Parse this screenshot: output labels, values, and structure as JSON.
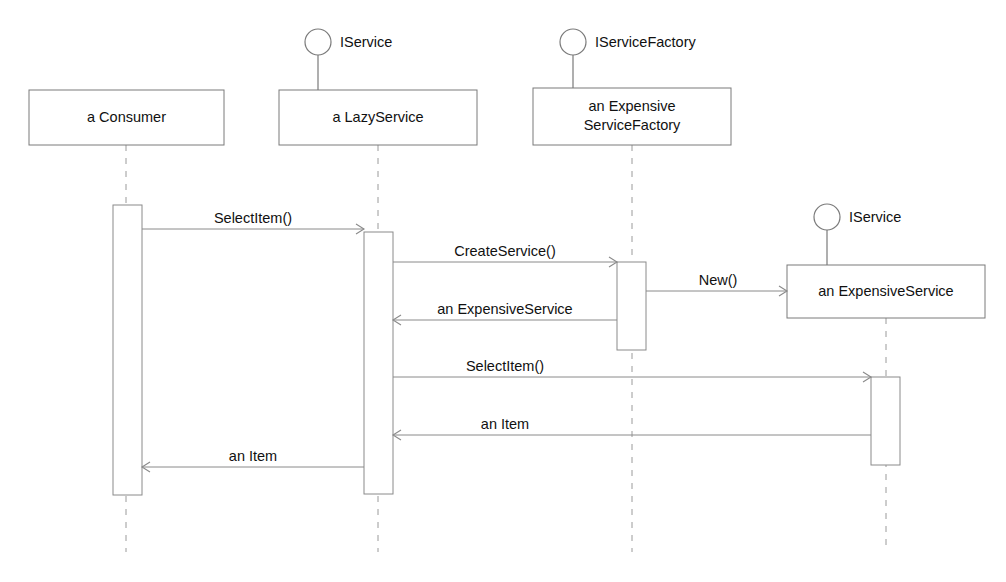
{
  "diagram": {
    "type": "uml-sequence-diagram",
    "title": "",
    "background_color": "#ffffff",
    "line_color": "#8a8a8a",
    "text_color": "#111111"
  },
  "participants": [
    {
      "id": "consumer",
      "label": "a Consumer",
      "label_line1": "a Consumer",
      "label_line2": "",
      "interface": null,
      "box": {
        "x": 29,
        "y": 90,
        "w": 195,
        "h": 55
      },
      "lifeline_x": 126,
      "lifeline_top": 145,
      "lifeline_bottom": 552
    },
    {
      "id": "lazyservice",
      "label": "a LazyService",
      "label_line1": "a LazyService",
      "label_line2": "",
      "interface": "IService",
      "box": {
        "x": 279,
        "y": 90,
        "w": 198,
        "h": 55
      },
      "lifeline_x": 378,
      "lifeline_top": 145,
      "lifeline_bottom": 552,
      "lollipop": {
        "cx": 318,
        "cy": 42,
        "r": 13,
        "stem_to_y": 90,
        "label_x": 340,
        "label_y": 43
      }
    },
    {
      "id": "factory",
      "label": "an Expensive ServiceFactory",
      "label_line1": "an Expensive",
      "label_line2": "ServiceFactory",
      "interface": "IServiceFactory",
      "box": {
        "x": 533,
        "y": 88,
        "w": 198,
        "h": 57
      },
      "lifeline_x": 632,
      "lifeline_top": 145,
      "lifeline_bottom": 552,
      "lollipop": {
        "cx": 573,
        "cy": 42,
        "r": 13,
        "stem_to_y": 88,
        "label_x": 595,
        "label_y": 43
      }
    },
    {
      "id": "expensiveservice",
      "label": "an ExpensiveService",
      "label_line1": "an ExpensiveService",
      "label_line2": "",
      "interface": "IService",
      "box": {
        "x": 787,
        "y": 265,
        "w": 198,
        "h": 53
      },
      "lifeline_x": 886,
      "lifeline_top": 318,
      "lifeline_bottom": 552,
      "lollipop": {
        "cx": 827,
        "cy": 217,
        "r": 13,
        "stem_to_y": 265,
        "label_x": 849,
        "label_y": 218
      }
    }
  ],
  "activations": [
    {
      "id": "act-consumer",
      "owner": "a Consumer",
      "x": 113,
      "y": 205,
      "w": 29,
      "h": 290
    },
    {
      "id": "act-lazyservice",
      "owner": "a LazyService",
      "x": 364,
      "y": 232,
      "w": 29,
      "h": 262
    },
    {
      "id": "act-factory",
      "owner": "an ExpensiveServiceFactory",
      "x": 617,
      "y": 262,
      "w": 29,
      "h": 88
    },
    {
      "id": "act-expensiveservice",
      "owner": "an ExpensiveService",
      "x": 871,
      "y": 377,
      "w": 29,
      "h": 88
    }
  ],
  "messages": [
    {
      "id": "msg-selectitem-1",
      "label": "SelectItem()",
      "from": "a Consumer",
      "to": "a LazyService",
      "direction": "right",
      "kind": "call",
      "x1": 142,
      "x2": 364,
      "y": 229,
      "label_x": 253,
      "label_y": 223
    },
    {
      "id": "msg-createservice",
      "label": "CreateService()",
      "from": "a LazyService",
      "to": "an ExpensiveServiceFactory",
      "direction": "right",
      "kind": "call",
      "x1": 393,
      "x2": 617,
      "y": 262,
      "label_x": 505,
      "label_y": 256
    },
    {
      "id": "msg-new",
      "label": "New()",
      "from": "an ExpensiveServiceFactory",
      "to": "an ExpensiveService",
      "direction": "right",
      "kind": "call",
      "x1": 646,
      "x2": 787,
      "y": 291,
      "label_x": 718,
      "label_y": 285
    },
    {
      "id": "msg-return-expensiveservice",
      "label": "an ExpensiveService",
      "from": "an ExpensiveServiceFactory",
      "to": "a LazyService",
      "direction": "left",
      "kind": "return",
      "x1": 617,
      "x2": 393,
      "y": 320,
      "label_x": 505,
      "label_y": 314
    },
    {
      "id": "msg-selectitem-2",
      "label": "SelectItem()",
      "from": "a LazyService",
      "to": "an ExpensiveService",
      "direction": "right",
      "kind": "call",
      "x1": 393,
      "x2": 871,
      "y": 377,
      "label_x": 505,
      "label_y": 371
    },
    {
      "id": "msg-return-item-1",
      "label": "an Item",
      "from": "an ExpensiveService",
      "to": "a LazyService",
      "direction": "left",
      "kind": "return",
      "x1": 871,
      "x2": 393,
      "y": 435,
      "label_x": 505,
      "label_y": 429
    },
    {
      "id": "msg-return-item-2",
      "label": "an Item",
      "from": "a LazyService",
      "to": "a Consumer",
      "direction": "left",
      "kind": "return",
      "x1": 364,
      "x2": 142,
      "y": 467,
      "label_x": 253,
      "label_y": 461
    }
  ]
}
